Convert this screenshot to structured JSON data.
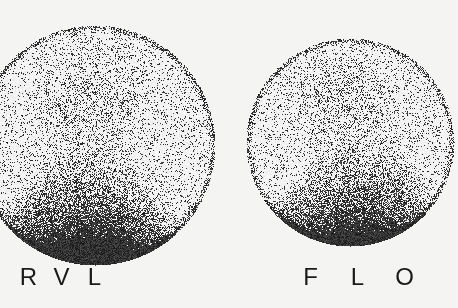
{
  "figure": {
    "background_color": "#f4f4f2",
    "ink_color": "#111111",
    "panels": [
      {
        "id": "left",
        "labels": [
          "R",
          "V",
          "L"
        ]
      },
      {
        "id": "right",
        "labels": [
          "F",
          "L",
          "O"
        ]
      }
    ]
  }
}
